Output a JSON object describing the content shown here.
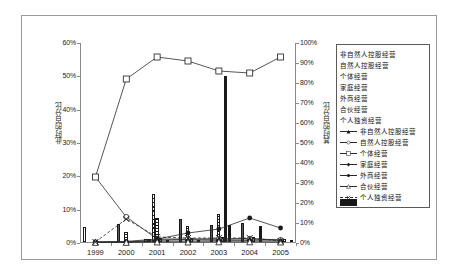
{
  "axes": {
    "left_title": "此时的百分比",
    "right_title": "其时的百分比",
    "left_ticks": [
      "60%",
      "50%",
      "40%",
      "30%",
      "20%",
      "10%",
      "0%"
    ],
    "right_ticks": [
      "100%",
      "90%",
      "80%",
      "70%",
      "60%",
      "50%",
      "40%",
      "30%",
      "20%",
      "10%",
      "0%"
    ],
    "x_ticks": [
      "1999",
      "2000",
      "2001",
      "2002",
      "2003",
      "2004",
      "2005"
    ]
  },
  "legend": {
    "bars": [
      {
        "label": "非自然人控股经营",
        "pattern": "p-blank"
      },
      {
        "label": "自然人控股经营",
        "pattern": "p-solidgray"
      },
      {
        "label": "个体经营",
        "pattern": "p-crosshatch"
      },
      {
        "label": "家庭经营",
        "pattern": "p-hlines"
      },
      {
        "label": "外商经营",
        "pattern": "p-diag"
      },
      {
        "label": "合伙经营",
        "pattern": "p-brick"
      },
      {
        "label": "个人独资经营",
        "pattern": "p-black"
      }
    ],
    "lines": [
      {
        "label": "非自然人控股经营",
        "marker": "triangle-filled",
        "style": "solid"
      },
      {
        "label": "自然人控股经营",
        "marker": "circle-open",
        "style": "solid"
      },
      {
        "label": "个体经营",
        "marker": "square-open",
        "style": "solid"
      },
      {
        "label": "家庭经营",
        "marker": "diamond-filled",
        "style": "solid"
      },
      {
        "label": "外商经营",
        "marker": "circle-filled",
        "style": "solid"
      },
      {
        "label": "合伙经营",
        "marker": "triangle-open",
        "style": "solid"
      },
      {
        "label": "个人独资经营",
        "marker": "x-cross",
        "style": "dashed"
      }
    ]
  },
  "chart_data": {
    "type": "bar",
    "title": "",
    "xlabel": "",
    "ylabel": "此时的百分比",
    "y2label": "其时的百分比",
    "categories": [
      "1999",
      "2000",
      "2001",
      "2002",
      "2003",
      "2004",
      "2005"
    ],
    "ylim": [
      0,
      60
    ],
    "y2lim": [
      0,
      100
    ],
    "grid": false,
    "legend_position": "right",
    "bar_series": [
      {
        "name": "非自然人控股经营",
        "axis": "left",
        "values": [
          4.5,
          0.0,
          0.8,
          0.0,
          0.0,
          0.0,
          0.0
        ]
      },
      {
        "name": "自然人控股经营",
        "axis": "left",
        "values": [
          0.0,
          5.5,
          1.0,
          6.8,
          5.0,
          5.6,
          0.0
        ]
      },
      {
        "name": "个体经营",
        "axis": "left",
        "values": [
          0.0,
          0.0,
          14.3,
          0.0,
          0.0,
          0.0,
          0.0
        ]
      },
      {
        "name": "家庭经营",
        "axis": "left",
        "values": [
          0.0,
          3.0,
          7.2,
          4.7,
          8.5,
          0.0,
          0.0
        ]
      },
      {
        "name": "外商经营",
        "axis": "left",
        "values": [
          0.0,
          0.0,
          1.2,
          1.2,
          1.4,
          1.4,
          0.8
        ]
      },
      {
        "name": "合伙经营",
        "axis": "left",
        "values": [
          0.0,
          0.0,
          0.0,
          0.0,
          49.8,
          0.0,
          0.0
        ]
      },
      {
        "name": "个人独资经营",
        "axis": "left",
        "values": [
          0.0,
          0.0,
          0.6,
          0.6,
          5.1,
          4.9,
          0.4
        ]
      }
    ],
    "line_series": [
      {
        "name": "非自然人控股经营",
        "axis": "right",
        "values": [
          0.5,
          0.5,
          1.5,
          1.8,
          2.0,
          2.2,
          1.5
        ]
      },
      {
        "name": "自然人控股经营",
        "axis": "right",
        "values": [
          33.0,
          13.0,
          2.0,
          2.0,
          2.0,
          2.0,
          1.5
        ]
      },
      {
        "name": "个体经营",
        "axis": "right",
        "values": [
          33.0,
          82.0,
          93.0,
          91.0,
          86.0,
          85.0,
          93.0
        ]
      },
      {
        "name": "家庭经营",
        "axis": "right",
        "values": [
          0.5,
          0.5,
          1.0,
          1.0,
          1.2,
          1.2,
          1.0
        ]
      },
      {
        "name": "外商经营",
        "axis": "right",
        "values": [
          0.5,
          0.8,
          2.0,
          5.0,
          7.0,
          12.5,
          7.5
        ]
      },
      {
        "name": "合伙经营",
        "axis": "right",
        "values": [
          0.3,
          0.3,
          0.5,
          0.5,
          0.6,
          0.6,
          0.5
        ]
      },
      {
        "name": "个人独资经营",
        "axis": "right",
        "values": [
          0.5,
          12.0,
          3.0,
          2.5,
          2.5,
          2.5,
          1.0
        ]
      }
    ]
  }
}
